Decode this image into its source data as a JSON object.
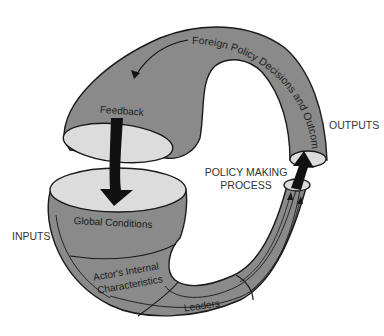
{
  "diagram": {
    "labels": {
      "outcomes": "Foreign Policy Decisions and Outcomes",
      "feedback": "Feedback",
      "outputs": "OUTPUTS",
      "policy_making_line1": "POLICY MAKING",
      "policy_making_line2": "PROCESS",
      "inputs": "INPUTS",
      "global_conditions": "Global Conditions",
      "actors_internal_line1": "Actor's Internal",
      "actors_internal_line2": "Characteristics",
      "leaders": "Leaders"
    },
    "colors": {
      "tube_fill": "#8a8a8a",
      "opening_fill": "#dcdcdc",
      "outline": "#1a1a1a",
      "arrow": "#111111",
      "background": "#ffffff"
    }
  }
}
